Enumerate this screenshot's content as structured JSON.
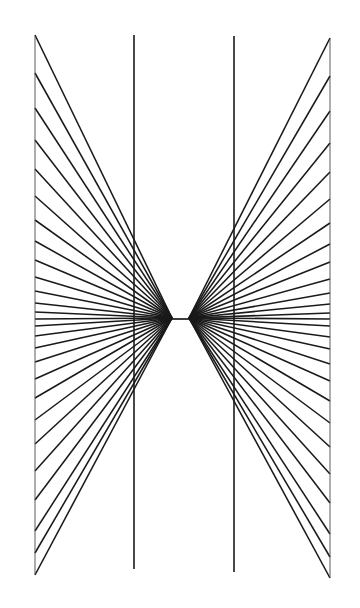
{
  "figure": {
    "name": "hering-illusion",
    "canvas": {
      "width": 360,
      "height": 608,
      "background": "#ffffff"
    },
    "stroke_color": "#1a1a1a",
    "edge_stroke_color": "#4a4a4a",
    "left_fan": {
      "label": "left-radiating-fan",
      "apex_x": 172,
      "apex_y": 318,
      "edge_x": 35,
      "edge_top_y": 35,
      "edge_bottom_y": 575,
      "ray_count": 27
    },
    "right_fan": {
      "label": "right-radiating-fan",
      "apex_x": 189,
      "apex_y": 318,
      "edge_x": 330,
      "edge_top_y": 38,
      "edge_bottom_y": 578,
      "ray_count": 27
    },
    "vertical_lines": [
      {
        "label": "left-vertical-line",
        "x": 134,
        "y_top": 35,
        "y_bottom": 569
      },
      {
        "label": "right-vertical-line",
        "x": 234,
        "y_top": 36,
        "y_bottom": 572
      }
    ],
    "edge_lines": [
      {
        "label": "left-edge-boundary",
        "x": 35,
        "y_top": 36,
        "y_bottom": 574
      },
      {
        "label": "right-edge-boundary",
        "x": 330,
        "y_top": 39,
        "y_bottom": 577
      }
    ],
    "horizontal_axis": {
      "label": "central-horizontal-line",
      "y": 319,
      "x_start": 35,
      "x_end": 330
    }
  },
  "chart_data": {
    "type": "line",
    "subtitle": "",
    "xlabel": "",
    "ylabel": "",
    "grid": false,
    "legend": "none",
    "xlim": [
      0,
      360
    ],
    "ylim": [
      608,
      0
    ],
    "annotations": [],
    "series": [
      {
        "name": "left-fan-rays",
        "kind": "radial-fan",
        "apex": [
          172,
          318
        ],
        "endpoint_x": 35,
        "endpoint_y_values": [
          35,
          73,
          108,
          140,
          169,
          196,
          220,
          241,
          260,
          277,
          291,
          303,
          312,
          319,
          326,
          336,
          348,
          362,
          379,
          398,
          420,
          444,
          471,
          500,
          531,
          553,
          575
        ]
      },
      {
        "name": "right-fan-rays",
        "kind": "radial-fan",
        "apex": [
          189,
          318
        ],
        "endpoint_x": 330,
        "endpoint_y_values": [
          38,
          76,
          111,
          143,
          172,
          199,
          223,
          244,
          262,
          279,
          293,
          304,
          313,
          319,
          326,
          337,
          349,
          364,
          381,
          401,
          423,
          447,
          474,
          503,
          534,
          557,
          578
        ]
      },
      {
        "name": "vertical-lines",
        "kind": "vertical",
        "x_values": [
          134,
          234
        ],
        "y_range": [
          35,
          570
        ]
      }
    ]
  }
}
